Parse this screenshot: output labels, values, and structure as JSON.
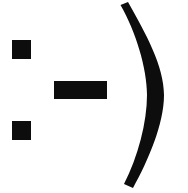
{
  "image": {
    "kind": "emoticon-glyph",
    "meaning": "smiley-face-sideways",
    "text_equivalent": ":-)",
    "alt_text": "Sideways smiley face emoticon drawn as two square eyes, a rectangular dash nose and a large curved closing parenthesis mouth",
    "width": 188,
    "height": 193,
    "background_color": "#ffffff",
    "ink_color": "#0d0d0d"
  },
  "parts": {
    "eye_top": {
      "label": "eye-top",
      "shape": "square",
      "x": 12,
      "y": 40,
      "width": 19,
      "height": 19,
      "color": "#0d0d0d"
    },
    "eye_bottom": {
      "label": "eye-bottom",
      "shape": "square",
      "x": 12,
      "y": 121,
      "width": 19,
      "height": 19,
      "color": "#0d0d0d"
    },
    "nose_dash": {
      "label": "nose-dash",
      "shape": "rectangle",
      "x": 54,
      "y": 81,
      "width": 53,
      "height": 18,
      "color": "#0d0d0d"
    },
    "mouth_paren": {
      "label": "mouth-closing-parenthesis",
      "shape": "crescent-arc",
      "top_tip_x": 128,
      "top_tip_y": 2,
      "bottom_tip_x": 133,
      "bottom_tip_y": 188,
      "max_right_x": 164,
      "stroke_max_width": 17,
      "color": "#0d0d0d"
    }
  }
}
